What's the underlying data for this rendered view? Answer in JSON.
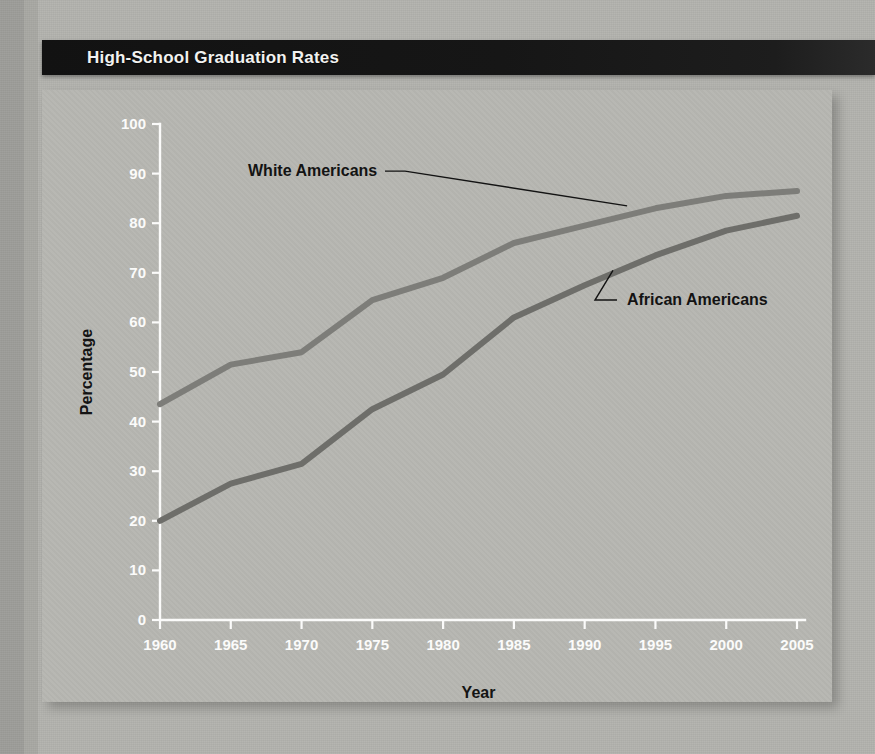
{
  "document": {
    "title": "High-School Graduation Rates"
  },
  "chart_data": {
    "type": "line",
    "title": "High-School Graduation Rates",
    "xlabel": "Year",
    "ylabel": "Percentage",
    "xlim": [
      1960,
      2005
    ],
    "ylim": [
      0,
      100
    ],
    "grid": false,
    "legend_position": "inline-annotations",
    "x": [
      1960,
      1965,
      1970,
      1975,
      1980,
      1985,
      1990,
      1995,
      2000,
      2005
    ],
    "xtick_labels": [
      "1960",
      "1965",
      "1970",
      "1975",
      "1980",
      "1985",
      "1990",
      "1995",
      "2000",
      "2005"
    ],
    "ytick_labels": [
      "0",
      "10",
      "20",
      "30",
      "40",
      "50",
      "60",
      "70",
      "80",
      "90",
      "100"
    ],
    "ytick_values": [
      0,
      10,
      20,
      30,
      40,
      50,
      60,
      70,
      80,
      90,
      100
    ],
    "series": [
      {
        "name": "White Americans",
        "color": "#7d7d79",
        "values": [
          43.5,
          51.5,
          54.0,
          64.5,
          69.0,
          76.0,
          79.5,
          83.0,
          85.5,
          86.5
        ]
      },
      {
        "name": "African Americans",
        "color": "#6e6e6a",
        "values": [
          20.0,
          27.5,
          31.5,
          42.5,
          49.5,
          61.0,
          67.5,
          73.5,
          78.5,
          81.5
        ]
      }
    ],
    "annotations": [
      {
        "text": "White Americans",
        "anchor_year": 1993,
        "anchor_value": 83.5
      },
      {
        "text": "African Americans",
        "anchor_year": 1992,
        "anchor_value": 70.5
      }
    ]
  },
  "colors": {
    "title_bar": "#161616",
    "title_text": "#f2f2f0",
    "panel": "#b6b6b1",
    "axis": "#fbfbfa",
    "annotation_text": "#131313"
  }
}
